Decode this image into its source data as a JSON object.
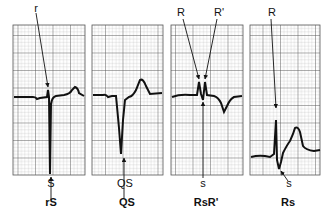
{
  "panels": [
    {
      "id": "rS",
      "name": "rS",
      "top_labels": [
        "r"
      ],
      "bottom_label": "S"
    },
    {
      "id": "QS",
      "name": "QS",
      "top_labels": [],
      "bottom_label": "QS"
    },
    {
      "id": "RsR",
      "name": "RsR'",
      "top_labels": [
        "R",
        "R'"
      ],
      "bottom_label": "s"
    },
    {
      "id": "Rs",
      "name": "Rs",
      "top_labels": [
        "R"
      ],
      "bottom_label": "s"
    }
  ],
  "colors": {
    "grid_major": "#555555",
    "grid_minor": "#9a9a9a",
    "trace": "#111111",
    "background": "#ffffff"
  }
}
